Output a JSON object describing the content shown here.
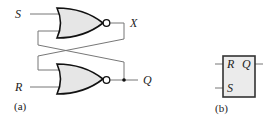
{
  "figure_a": {
    "caption": "(a)",
    "inputs": {
      "top": "S",
      "bottom": "R"
    },
    "outputs": {
      "top": "X",
      "bottom": "Q"
    },
    "gates": [
      {
        "type": "NOR",
        "position": "top"
      },
      {
        "type": "NOR",
        "position": "bottom"
      }
    ],
    "description": "SR latch built from two cross-coupled NOR gates"
  },
  "figure_b": {
    "caption": "(b)",
    "block_inputs": {
      "top": "R",
      "bottom": "S"
    },
    "block_output": "Q",
    "description": "SR latch block symbol"
  },
  "colors": {
    "gate_fill": "#e6e6e6",
    "outline": "#111111",
    "wire": "#777777",
    "text": "#222222"
  }
}
